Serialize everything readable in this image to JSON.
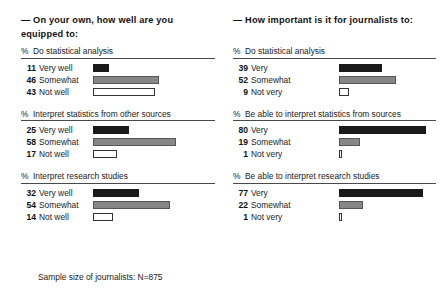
{
  "chart_data": {
    "type": "bar",
    "title": "",
    "xlabel": "",
    "ylabel": "",
    "grid": false,
    "legend": "none",
    "units": "percent",
    "xlim": [
      0,
      100
    ],
    "note": "Sample size of journalists: N=875",
    "panels": [
      {
        "panel_title": "— On your own, how well are you equipped to:",
        "percent_sign": "%",
        "groups": [
          {
            "label": "Do statistical analysis",
            "categories": [
              "Very well",
              "Somewhat",
              "Not well"
            ],
            "values": [
              11,
              46,
              43
            ],
            "styles": [
              "very",
              "somewhat",
              "not"
            ]
          },
          {
            "label": "Interpret statistics from other sources",
            "categories": [
              "Very well",
              "Somewhat",
              "Not well"
            ],
            "values": [
              25,
              58,
              17
            ],
            "styles": [
              "very",
              "somewhat",
              "not"
            ]
          },
          {
            "label": "Interpret research studies",
            "categories": [
              "Very well",
              "Somewhat",
              "Not well"
            ],
            "values": [
              32,
              54,
              14
            ],
            "styles": [
              "very",
              "somewhat",
              "not"
            ]
          }
        ]
      },
      {
        "panel_title": "— How important is it for journalists to:",
        "percent_sign": "%",
        "groups": [
          {
            "label": "Do statistical analysis",
            "categories": [
              "Very",
              "Somewhat",
              "Not very"
            ],
            "values": [
              39,
              52,
              9
            ],
            "styles": [
              "very",
              "somewhat",
              "not"
            ]
          },
          {
            "label": "Be able to interpret statistics from sources",
            "categories": [
              "Very",
              "Somewhat",
              "Not very"
            ],
            "values": [
              80,
              19,
              1
            ],
            "styles": [
              "very",
              "somewhat",
              "not"
            ]
          },
          {
            "label": "Be able to interpret research studies",
            "categories": [
              "Very",
              "Somewhat",
              "Not very"
            ],
            "values": [
              77,
              22,
              1
            ],
            "styles": [
              "very",
              "somewhat",
              "not"
            ]
          }
        ]
      }
    ],
    "colors": {
      "very": "#1a1a1a",
      "somewhat": "#878787",
      "not": "#ffffff",
      "outline": "#333333",
      "rule": "#4a4a4a",
      "text": "#1a1a1a"
    },
    "scale_px_per_unit": {
      "left": 1.43,
      "right": 1.09
    }
  }
}
